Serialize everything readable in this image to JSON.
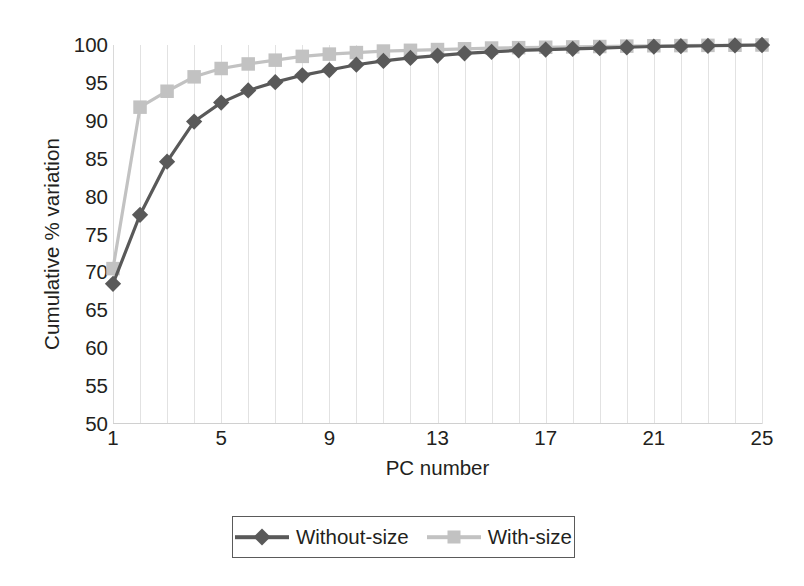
{
  "chart_data": {
    "type": "line",
    "title": "",
    "xlabel": "PC number",
    "ylabel": "Cumulative % variation",
    "xlim": [
      1,
      25
    ],
    "ylim": [
      50,
      100
    ],
    "grid": "vertical",
    "legend_position": "bottom-center",
    "x_tick_labels": [
      "1",
      "5",
      "9",
      "13",
      "17",
      "21",
      "25"
    ],
    "x_tick_values": [
      1,
      5,
      9,
      13,
      17,
      21,
      25
    ],
    "y_tick_labels": [
      "50",
      "55",
      "60",
      "65",
      "70",
      "75",
      "80",
      "85",
      "90",
      "95",
      "100"
    ],
    "y_tick_values": [
      50,
      55,
      60,
      65,
      70,
      75,
      80,
      85,
      90,
      95,
      100
    ],
    "x": [
      1,
      2,
      3,
      4,
      5,
      6,
      7,
      8,
      9,
      10,
      11,
      12,
      13,
      14,
      15,
      16,
      17,
      18,
      19,
      20,
      21,
      22,
      23,
      24,
      25
    ],
    "series": [
      {
        "name": "Without-size",
        "color": "#595959",
        "marker": "diamond",
        "values": [
          68.5,
          77.6,
          84.6,
          89.9,
          92.4,
          94.0,
          95.1,
          96.0,
          96.7,
          97.4,
          97.9,
          98.3,
          98.6,
          98.9,
          99.1,
          99.3,
          99.4,
          99.5,
          99.6,
          99.7,
          99.8,
          99.85,
          99.9,
          99.95,
          100.0
        ]
      },
      {
        "name": "With-size",
        "color": "#c2c2c2",
        "marker": "square",
        "values": [
          70.5,
          91.8,
          93.9,
          95.8,
          96.9,
          97.5,
          98.0,
          98.5,
          98.8,
          99.0,
          99.2,
          99.3,
          99.4,
          99.5,
          99.6,
          99.65,
          99.7,
          99.75,
          99.8,
          99.85,
          99.9,
          99.92,
          99.95,
          99.97,
          100.0
        ]
      }
    ]
  },
  "axes": {
    "x_title": "PC number",
    "y_title": "Cumulative % variation"
  },
  "legend": {
    "entries": [
      {
        "label": "Without-size",
        "color": "#595959",
        "marker": "diamond"
      },
      {
        "label": "With-size",
        "color": "#c2c2c2",
        "marker": "square"
      }
    ]
  },
  "colors": {
    "without_size": "#595959",
    "with_size": "#c2c2c2",
    "gridline": "#e2e2e2",
    "axis": "#d0d0d0",
    "text": "#231f20",
    "legend_border": "#5a5a5a",
    "background": "#ffffff"
  }
}
